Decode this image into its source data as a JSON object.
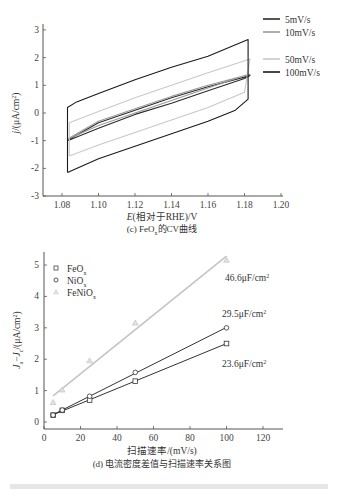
{
  "chart_data": [
    {
      "type": "line",
      "title": "(c) FeOx的CV曲线",
      "caption": "(c) FeO",
      "caption_sub": "x",
      "caption_tail": "的CV曲线",
      "xlabel_italic": "E",
      "xlabel_rest": "(相对于RHE)/V",
      "ylabel_italic": "j",
      "ylabel_rest": "/(μA/cm",
      "ylabel_sup": "2",
      "ylabel_close": ")",
      "xlim": [
        1.07,
        1.2
      ],
      "ylim": [
        -3,
        3.5
      ],
      "xticks": [
        "1.08",
        "1.10",
        "1.12",
        "1.14",
        "1.16",
        "1.18",
        "1.20"
      ],
      "yticks": [
        "-3",
        "-2",
        "-1",
        "0",
        "1",
        "2",
        "3"
      ],
      "grid": false,
      "legend_position": "top-right",
      "series": [
        {
          "name": "5mV/s",
          "color": "#2a2a2a",
          "anodic": [
            [
              1.083,
              -1.0
            ],
            [
              1.1,
              -0.55
            ],
            [
              1.12,
              -0.05
            ],
            [
              1.14,
              0.35
            ],
            [
              1.16,
              0.8
            ],
            [
              1.18,
              1.25
            ]
          ],
          "cathodic": [
            [
              1.183,
              1.35
            ],
            [
              1.16,
              0.95
            ],
            [
              1.14,
              0.55
            ],
            [
              1.12,
              0.1
            ],
            [
              1.1,
              -0.35
            ],
            [
              1.084,
              -0.95
            ]
          ]
        },
        {
          "name": "10mV/s",
          "color": "#9a9a9a",
          "anodic": [
            [
              1.083,
              -0.95
            ],
            [
              1.1,
              -0.45
            ],
            [
              1.12,
              0.0
            ],
            [
              1.14,
              0.45
            ],
            [
              1.16,
              0.9
            ],
            [
              1.18,
              1.35
            ]
          ],
          "cathodic": [
            [
              1.183,
              1.4
            ],
            [
              1.16,
              1.0
            ],
            [
              1.14,
              0.6
            ],
            [
              1.12,
              0.15
            ],
            [
              1.1,
              -0.3
            ],
            [
              1.084,
              -0.9
            ]
          ]
        },
        {
          "name": "50mV/s",
          "color": "#c8c8c8",
          "anodic": [
            [
              1.084,
              -1.55
            ],
            [
              1.1,
              -1.15
            ],
            [
              1.12,
              -0.7
            ],
            [
              1.14,
              -0.25
            ],
            [
              1.16,
              0.2
            ],
            [
              1.18,
              0.75
            ]
          ],
          "cathodic": [
            [
              1.183,
              1.95
            ],
            [
              1.16,
              1.45
            ],
            [
              1.14,
              1.0
            ],
            [
              1.12,
              0.55
            ],
            [
              1.1,
              0.05
            ],
            [
              1.084,
              -0.35
            ]
          ]
        },
        {
          "name": "100mV/s",
          "color": "#1a1a1a",
          "anodic": [
            [
              1.083,
              -2.15
            ],
            [
              1.1,
              -1.65
            ],
            [
              1.12,
              -1.2
            ],
            [
              1.14,
              -0.75
            ],
            [
              1.16,
              -0.3
            ],
            [
              1.175,
              0.1
            ],
            [
              1.182,
              0.5
            ]
          ],
          "cathodic": [
            [
              1.182,
              2.65
            ],
            [
              1.16,
              2.05
            ],
            [
              1.14,
              1.65
            ],
            [
              1.12,
              1.2
            ],
            [
              1.1,
              0.7
            ],
            [
              1.088,
              0.4
            ],
            [
              1.083,
              0.2
            ]
          ]
        }
      ]
    },
    {
      "type": "scatter",
      "title": "(d) 电流密度差值与扫描速率关系图",
      "caption": "(d) 电流密度差值与扫描速率关系图",
      "xlabel": "扫描速率/(mV/s)",
      "ylabel": "Ja−Jc/(μA/cm²)",
      "ylabel_parts": {
        "j1": "J",
        "s1": "a",
        "minus": "−",
        "j2": "J",
        "s2": "c",
        "rest": "/(μA/cm",
        "sup": "2",
        "close": ")"
      },
      "xlim": [
        0,
        130
      ],
      "ylim": [
        -0.2,
        5.5
      ],
      "xticks": [
        "0",
        "20",
        "40",
        "60",
        "80",
        "100",
        "120"
      ],
      "yticks": [
        "0",
        "1",
        "2",
        "3",
        "4",
        "5"
      ],
      "grid": false,
      "legend_position": "top-left",
      "series": [
        {
          "name": "FeOx",
          "label_main": "FeO",
          "label_sub": "x",
          "marker": "square",
          "color": "#333333",
          "x": [
            5,
            10,
            25,
            50,
            100
          ],
          "y": [
            0.22,
            0.37,
            0.7,
            1.3,
            2.5
          ],
          "fit_label": "23.6μF/cm²",
          "fit_main": "23.6μF/cm",
          "fit_sup": "2"
        },
        {
          "name": "NiOx",
          "label_main": "NiO",
          "label_sub": "x",
          "marker": "circle",
          "color": "#333333",
          "x": [
            5,
            10,
            25,
            50,
            100
          ],
          "y": [
            0.22,
            0.38,
            0.82,
            1.58,
            3.0
          ],
          "fit_label": "29.5μF/cm²",
          "fit_main": "29.5μF/cm",
          "fit_sup": "2"
        },
        {
          "name": "FeNiOx",
          "label_main": "FeNiO",
          "label_sub": "x",
          "marker": "triangle",
          "color": "#c4c4c4",
          "x": [
            5,
            10,
            25,
            50,
            100
          ],
          "y": [
            0.62,
            1.02,
            1.95,
            3.15,
            5.15
          ],
          "fit_label": "46.6μF/cm²",
          "fit_main": "46.6μF/cm",
          "fit_sup": "2"
        }
      ]
    }
  ]
}
